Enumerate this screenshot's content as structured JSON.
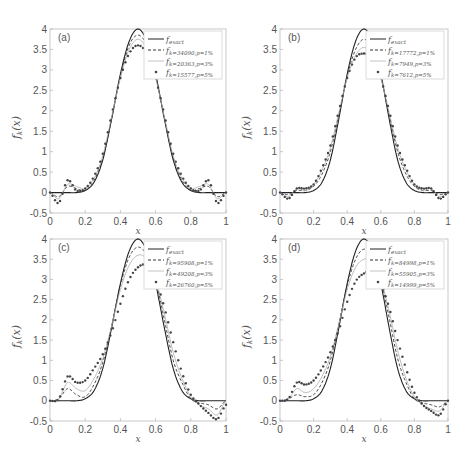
{
  "figure": {
    "colors": {
      "exact": "#222222",
      "p1": "#333333",
      "p3": "#aaaaaa",
      "p5": "#444444",
      "axis": "#bbbbbb",
      "text": "#555555"
    },
    "yticks": [
      "-0.5",
      "0",
      "0.5",
      "1",
      "1.5",
      "2",
      "2.5",
      "3",
      "3.5",
      "4"
    ],
    "xticks": [
      "0",
      "0.2",
      "0.4",
      "0.6",
      "0.8",
      "1"
    ]
  },
  "chart_data": [
    {
      "type": "line",
      "panel_label": "(a)",
      "xlabel": "x",
      "ylabel": "f_k(x)",
      "xlim": [
        0,
        1
      ],
      "ylim": [
        -0.5,
        4
      ],
      "legend_position": "upper right",
      "legend": [
        "f_exact",
        "f_{k=34090,p=1%}",
        "f_{k=20363,p=3%}",
        "f_{k=15577,p=5%}"
      ],
      "x": [
        0,
        0.05,
        0.1,
        0.15,
        0.2,
        0.25,
        0.3,
        0.35,
        0.4,
        0.45,
        0.5,
        0.55,
        0.6,
        0.65,
        0.7,
        0.75,
        0.8,
        0.85,
        0.9,
        0.95,
        1
      ],
      "series": [
        {
          "name": "f_exact",
          "style": "solid",
          "values": [
            0,
            0,
            0,
            0,
            0.05,
            0.25,
            0.8,
            1.8,
            2.9,
            3.7,
            4.0,
            3.7,
            2.9,
            1.8,
            0.8,
            0.25,
            0.05,
            0,
            0,
            0,
            0
          ]
        },
        {
          "name": "f_{k=34090,p=1%}",
          "style": "dashed",
          "values": [
            0,
            -0.1,
            0.15,
            0.1,
            0.05,
            0.3,
            0.85,
            1.8,
            2.85,
            3.6,
            3.85,
            3.6,
            2.85,
            1.8,
            0.85,
            0.3,
            0.05,
            0.1,
            0.15,
            -0.1,
            0
          ]
        },
        {
          "name": "f_{k=20363,p=3%}",
          "style": "thin",
          "values": [
            0,
            -0.15,
            0.2,
            0.15,
            0.1,
            0.35,
            0.9,
            1.85,
            2.8,
            3.5,
            3.75,
            3.5,
            2.8,
            1.85,
            0.9,
            0.35,
            0.1,
            0.15,
            0.2,
            -0.15,
            0
          ]
        },
        {
          "name": "f_{k=15577,p=5%}",
          "style": "dots",
          "values": [
            0,
            -0.25,
            0.3,
            0.05,
            0.1,
            0.4,
            0.95,
            1.9,
            2.8,
            3.4,
            3.6,
            3.4,
            2.8,
            1.9,
            0.95,
            0.4,
            0.1,
            0.05,
            0.3,
            -0.25,
            0
          ]
        }
      ]
    },
    {
      "type": "line",
      "panel_label": "(b)",
      "xlabel": "x",
      "ylabel": "f_k(x)",
      "xlim": [
        0,
        1
      ],
      "ylim": [
        -0.5,
        4
      ],
      "legend_position": "upper right",
      "legend": [
        "f_exact",
        "f_{k=17772,p=1%}",
        "f_{k=7949,p=3%}",
        "f_{k=7612,p=5%}"
      ],
      "x": [
        0,
        0.05,
        0.1,
        0.15,
        0.2,
        0.25,
        0.3,
        0.35,
        0.4,
        0.45,
        0.5,
        0.55,
        0.6,
        0.65,
        0.7,
        0.75,
        0.8,
        0.85,
        0.9,
        0.95,
        1
      ],
      "series": [
        {
          "name": "f_exact",
          "style": "solid",
          "values": [
            0,
            0,
            0,
            0,
            0.05,
            0.25,
            0.8,
            1.8,
            2.9,
            3.7,
            4.0,
            3.7,
            2.9,
            1.8,
            0.8,
            0.25,
            0.05,
            0,
            0,
            0,
            0
          ]
        },
        {
          "name": "f_{k=17772,p=1%}",
          "style": "dashed",
          "values": [
            0,
            -0.05,
            0.05,
            0.05,
            0.15,
            0.45,
            1.0,
            1.9,
            2.85,
            3.5,
            3.75,
            3.5,
            2.85,
            1.9,
            1.0,
            0.45,
            0.15,
            0.05,
            0.05,
            -0.05,
            0
          ]
        },
        {
          "name": "f_{k=7949,p=3%}",
          "style": "thin",
          "values": [
            0,
            -0.1,
            0.1,
            0.05,
            0.2,
            0.55,
            1.1,
            1.95,
            2.8,
            3.35,
            3.55,
            3.35,
            2.8,
            1.95,
            1.1,
            0.55,
            0.2,
            0.05,
            0.1,
            -0.1,
            0
          ]
        },
        {
          "name": "f_{k=7612,p=5%}",
          "style": "dots",
          "values": [
            0,
            -0.15,
            0.1,
            0.1,
            0.2,
            0.6,
            1.15,
            2.0,
            2.8,
            3.3,
            3.4,
            3.3,
            2.8,
            2.0,
            1.15,
            0.6,
            0.2,
            0.1,
            0.1,
            -0.15,
            0
          ]
        }
      ]
    },
    {
      "type": "line",
      "panel_label": "(c)",
      "xlabel": "x",
      "ylabel": "f_k(x)",
      "xlim": [
        0,
        1
      ],
      "ylim": [
        -0.5,
        4
      ],
      "legend_position": "upper right",
      "legend": [
        "f_exact",
        "f_{k=95908,p=1%}",
        "f_{k=49208,p=3%}",
        "f_{k=26760,p=5%}"
      ],
      "x": [
        0,
        0.05,
        0.1,
        0.15,
        0.2,
        0.25,
        0.3,
        0.35,
        0.4,
        0.45,
        0.5,
        0.55,
        0.6,
        0.65,
        0.7,
        0.75,
        0.8,
        0.85,
        0.9,
        0.95,
        1
      ],
      "series": [
        {
          "name": "f_exact",
          "style": "solid",
          "values": [
            0,
            0,
            0,
            0,
            0.05,
            0.25,
            0.8,
            1.8,
            2.9,
            3.7,
            4.0,
            3.7,
            2.9,
            1.8,
            0.8,
            0.25,
            0.05,
            0,
            0,
            0,
            0
          ]
        },
        {
          "name": "f_{k=95908,p=1%}",
          "style": "dashed",
          "values": [
            0,
            0.05,
            0.3,
            0.15,
            0.1,
            0.4,
            0.95,
            1.85,
            2.85,
            3.55,
            3.8,
            3.6,
            3.0,
            2.0,
            1.0,
            0.45,
            0.05,
            -0.05,
            -0.1,
            -0.2,
            0
          ]
        },
        {
          "name": "f_{k=49208,p=3%}",
          "style": "thin",
          "values": [
            0,
            0.05,
            0.45,
            0.3,
            0.25,
            0.55,
            1.05,
            1.85,
            2.75,
            3.35,
            3.6,
            3.5,
            3.0,
            2.15,
            1.2,
            0.55,
            0.1,
            -0.1,
            -0.2,
            -0.35,
            0
          ]
        },
        {
          "name": "f_{k=26760,p=5%}",
          "style": "dots",
          "values": [
            0,
            0.05,
            0.6,
            0.45,
            0.5,
            0.8,
            1.15,
            1.7,
            2.4,
            3.0,
            3.3,
            3.35,
            3.0,
            2.3,
            1.45,
            0.7,
            0.15,
            -0.1,
            -0.3,
            -0.45,
            -0.1
          ]
        }
      ]
    },
    {
      "type": "line",
      "panel_label": "(d)",
      "xlabel": "x",
      "ylabel": "f_k(x)",
      "xlim": [
        0,
        1
      ],
      "ylim": [
        -0.5,
        4
      ],
      "legend_position": "upper right",
      "legend": [
        "f_exact",
        "f_{k=84998,p=1%}",
        "f_{k=55905,p=3%}",
        "f_{k=14999,p=5%}"
      ],
      "x": [
        0,
        0.05,
        0.1,
        0.15,
        0.2,
        0.25,
        0.3,
        0.35,
        0.4,
        0.45,
        0.5,
        0.55,
        0.6,
        0.65,
        0.7,
        0.75,
        0.8,
        0.85,
        0.9,
        0.95,
        1
      ],
      "series": [
        {
          "name": "f_exact",
          "style": "solid",
          "values": [
            0,
            0,
            0,
            0,
            0.05,
            0.25,
            0.8,
            1.8,
            2.9,
            3.7,
            4.0,
            3.7,
            2.9,
            1.8,
            0.8,
            0.25,
            0.05,
            0,
            0,
            0,
            0
          ]
        },
        {
          "name": "f_{k=84998,p=1%}",
          "style": "dashed",
          "values": [
            0,
            0.05,
            0.15,
            0.1,
            0.15,
            0.45,
            1.0,
            1.9,
            2.85,
            3.5,
            3.75,
            3.6,
            3.0,
            2.05,
            1.05,
            0.45,
            0.05,
            -0.05,
            -0.1,
            -0.15,
            0
          ]
        },
        {
          "name": "f_{k=55905,p=3%}",
          "style": "thin",
          "values": [
            0,
            0.05,
            0.3,
            0.2,
            0.3,
            0.6,
            1.1,
            1.9,
            2.75,
            3.3,
            3.5,
            3.45,
            3.0,
            2.2,
            1.25,
            0.55,
            0.1,
            -0.1,
            -0.2,
            -0.25,
            0
          ]
        },
        {
          "name": "f_{k=14999,p=5%}",
          "style": "dots",
          "values": [
            0,
            0.05,
            0.45,
            0.4,
            0.5,
            0.8,
            1.2,
            1.75,
            2.45,
            2.95,
            3.15,
            3.2,
            2.9,
            2.3,
            1.5,
            0.8,
            0.2,
            -0.1,
            -0.25,
            -0.35,
            0
          ]
        }
      ]
    }
  ]
}
